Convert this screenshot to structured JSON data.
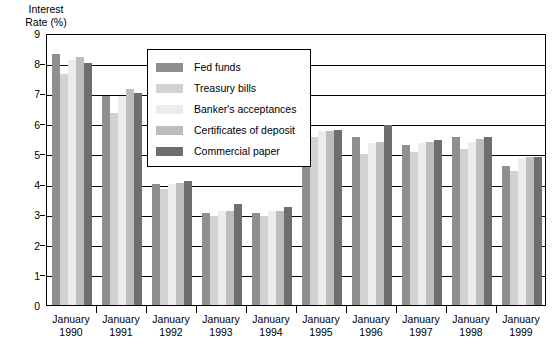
{
  "axis": {
    "ylabel": "Interest\nRate (%)",
    "yticks": [
      "0",
      "1",
      "2",
      "3",
      "4",
      "5",
      "6",
      "7",
      "8",
      "9"
    ],
    "xticks": [
      "January\n1990",
      "January\n1991",
      "January\n1992",
      "January\n1993",
      "January\n1994",
      "January\n1995",
      "January\n1996",
      "January\n1997",
      "January\n1998",
      "January\n1999"
    ]
  },
  "legend": {
    "items": [
      {
        "label": "Fed funds",
        "color": "#8f8f8f"
      },
      {
        "label": "Treasury bills",
        "color": "#d2d2d2"
      },
      {
        "label": "Banker's acceptances",
        "color": "#ececec"
      },
      {
        "label": "Certificates of deposit",
        "color": "#bdbdbd"
      },
      {
        "label": "Commercial paper",
        "color": "#6e6e6e"
      }
    ]
  },
  "chart_data": {
    "type": "bar",
    "title": "",
    "xlabel": "",
    "ylabel": "Interest Rate (%)",
    "ylim": [
      0,
      9
    ],
    "ytick_step": 1,
    "grid": true,
    "legend_position": "upper-center-inside",
    "categories": [
      "January 1990",
      "January 1991",
      "January 1992",
      "January 1993",
      "January 1994",
      "January 1995",
      "January 1996",
      "January 1997",
      "January 1998",
      "January 1999"
    ],
    "series": [
      {
        "name": "Fed funds",
        "color": "#8f8f8f",
        "values": [
          8.3,
          6.9,
          4.0,
          3.05,
          3.05,
          6.5,
          5.55,
          5.3,
          5.55,
          4.6
        ]
      },
      {
        "name": "Treasury bills",
        "color": "#d2d2d2",
        "values": [
          7.65,
          6.35,
          3.85,
          2.95,
          2.95,
          5.55,
          5.0,
          5.05,
          5.15,
          4.45
        ]
      },
      {
        "name": "Banker's acceptances",
        "color": "#ececec",
        "values": [
          8.1,
          6.9,
          4.0,
          3.1,
          3.1,
          5.75,
          5.35,
          5.35,
          5.4,
          4.85
        ]
      },
      {
        "name": "Certificates of deposit",
        "color": "#bdbdbd",
        "values": [
          8.2,
          7.15,
          4.05,
          3.1,
          3.1,
          5.75,
          5.4,
          5.4,
          5.5,
          4.9
        ]
      },
      {
        "name": "Commercial paper",
        "color": "#6e6e6e",
        "values": [
          8.0,
          7.0,
          4.1,
          3.35,
          3.25,
          5.8,
          5.95,
          5.45,
          5.55,
          4.9
        ]
      }
    ]
  }
}
